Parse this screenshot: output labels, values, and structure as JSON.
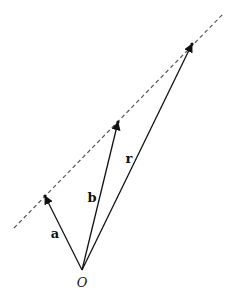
{
  "diagram": {
    "origin": {
      "label": "O",
      "x": 82,
      "y": 270,
      "label_x": 82,
      "label_y": 287
    },
    "line": {
      "x1": 14,
      "y1": 228,
      "x2": 223,
      "y2": 14,
      "style": "dashed",
      "color": "#555555"
    },
    "vectors": [
      {
        "name": "a",
        "label": "a",
        "x": 45,
        "y": 196,
        "label_x": 55,
        "label_y": 238
      },
      {
        "name": "b",
        "label": "b",
        "x": 118,
        "y": 122,
        "label_x": 92,
        "label_y": 202
      },
      {
        "name": "r",
        "label": "r",
        "x": 192,
        "y": 44,
        "label_x": 129,
        "label_y": 163
      }
    ],
    "stroke_color": "#111111"
  }
}
